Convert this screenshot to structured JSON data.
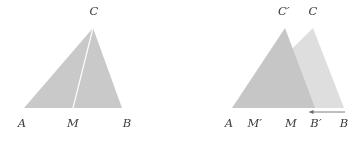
{
  "figure": {
    "background_color": "#ffffff",
    "label_color": "#3b3b3b",
    "fill_color": "#c9c9c9",
    "fill_color_second": "#d7d7d7",
    "overlap_color": "#a8a8a8",
    "median_color": "#ffffff",
    "arrow_color": "#6e6e6e"
  },
  "left_panel": {
    "name": "original-triangle",
    "vertices": {
      "A": {
        "label": "A",
        "x": 24,
        "y": 108
      },
      "B": {
        "label": "B",
        "x": 122,
        "y": 108
      },
      "C": {
        "label": "C",
        "x": 93,
        "y": 28
      },
      "M": {
        "label": "M",
        "x": 73,
        "y": 108
      }
    },
    "median": {
      "from": "C",
      "to": "M",
      "color": "#ffffff"
    },
    "labels": [
      {
        "id": "A",
        "text": "A",
        "x": 22,
        "y": 124
      },
      {
        "id": "M",
        "text": "M",
        "x": 73,
        "y": 124
      },
      {
        "id": "B",
        "text": "B",
        "x": 127,
        "y": 124
      },
      {
        "id": "C",
        "text": "C",
        "x": 94,
        "y": 12
      }
    ]
  },
  "right_panel": {
    "name": "overlapping-triangles",
    "triangle_original": {
      "name": "triangle-ABC",
      "A": {
        "x": 232,
        "y": 108
      },
      "B": {
        "x": 344,
        "y": 108
      },
      "C": {
        "x": 313,
        "y": 28
      }
    },
    "triangle_transformed": {
      "name": "triangle-ABprimeCprime",
      "A": {
        "x": 232,
        "y": 108
      },
      "Bp": {
        "x": 315,
        "y": 108
      },
      "Cp": {
        "x": 285,
        "y": 28
      }
    },
    "midpoints": {
      "M": {
        "label": "M",
        "x": 291,
        "y": 108
      },
      "Mp": {
        "label": "M'",
        "x": 254,
        "y": 108
      }
    },
    "arrow": {
      "name": "translation-arrow",
      "direction": "left",
      "x_start": 345,
      "x_end": 309,
      "y": 112,
      "color": "#6e6e6e"
    },
    "labels": [
      {
        "id": "A",
        "text": "A",
        "x": 229,
        "y": 124
      },
      {
        "id": "Mp",
        "text": "M",
        "prime": "′",
        "x": 254,
        "y": 124
      },
      {
        "id": "M",
        "text": "M",
        "x": 291,
        "y": 124
      },
      {
        "id": "Bp",
        "text": "B",
        "prime": "′",
        "x": 315,
        "y": 124
      },
      {
        "id": "B",
        "text": "B",
        "x": 344,
        "y": 124
      },
      {
        "id": "Cp",
        "text": "C",
        "prime": "′",
        "x": 284,
        "y": 12
      },
      {
        "id": "C",
        "text": "C",
        "x": 313,
        "y": 12
      }
    ]
  },
  "label_texts": {
    "A_left": "A",
    "M_left": "M",
    "B_left": "B",
    "C_left": "C",
    "A_right": "A",
    "Mprime_right": "M′",
    "M_right": "M",
    "Bprime_right": "B′",
    "B_right": "B",
    "Cprime_right": "C′",
    "C_right": "C"
  }
}
